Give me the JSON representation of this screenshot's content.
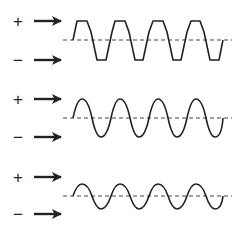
{
  "diagram": {
    "colors": {
      "stroke": "#222222",
      "baseline": "#444444",
      "background": "#ffffff"
    },
    "rows": [
      {
        "plus_label": "+",
        "minus_label": "−",
        "waveform": "clipped-square-like",
        "amplitude": "high"
      },
      {
        "plus_label": "+",
        "minus_label": "−",
        "waveform": "sine",
        "amplitude": "medium"
      },
      {
        "plus_label": "+",
        "minus_label": "−",
        "waveform": "sine",
        "amplitude": "low"
      }
    ],
    "cycles_per_wave": 4
  }
}
